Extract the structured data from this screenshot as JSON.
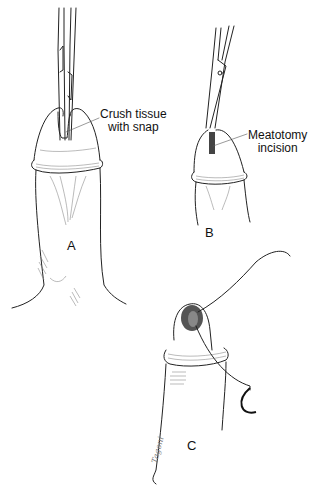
{
  "figure": {
    "panels": [
      {
        "id": "A",
        "letter": "A",
        "annotation": {
          "line1": "Crush tissue",
          "line2": "with snap"
        }
      },
      {
        "id": "B",
        "letter": "B",
        "annotation": {
          "line1": "Meatotomy",
          "line2": "incision"
        }
      },
      {
        "id": "C",
        "letter": "C"
      }
    ],
    "signature": "Tagoni",
    "colors": {
      "ink": "#222222",
      "background": "#ffffff",
      "shading": "#777777"
    }
  }
}
